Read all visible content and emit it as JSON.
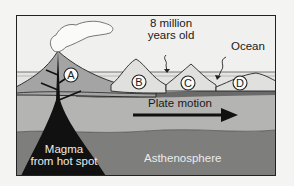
{
  "labels": {
    "age": [
      "8 million",
      "years old"
    ],
    "ocean": "Ocean",
    "plate_motion": "Plate motion",
    "magma": [
      "Magma",
      "from hot spot"
    ],
    "asthenosphere": "Asthenosphere"
  },
  "islands": [
    {
      "id": "A",
      "label": "A"
    },
    {
      "id": "B",
      "label": "B"
    },
    {
      "id": "C",
      "label": "C"
    },
    {
      "id": "D",
      "label": "D"
    }
  ],
  "colors": {
    "sky": "#f0f0ee",
    "ocean": "#e6e6e4",
    "island": "#a4a4a4",
    "lithosphere": "#b4b4b2",
    "crust_band": "#6a6a6a",
    "asthenosphere": "#7e7e7c",
    "magma": "#111111",
    "outline": "#222222"
  }
}
